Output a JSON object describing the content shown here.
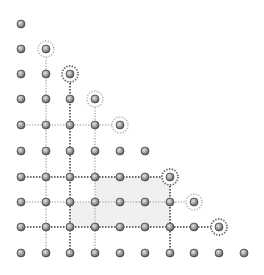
{
  "diagram": {
    "type": "triangular-lattice-grid",
    "columns_x": [
      21,
      46,
      70,
      95,
      120,
      145,
      170,
      194,
      219,
      244
    ],
    "rows_y": [
      24,
      49,
      74,
      99,
      125,
      151,
      177,
      202,
      227,
      253
    ],
    "rows_dot_count": [
      1,
      2,
      3,
      4,
      5,
      6,
      7,
      8,
      9,
      10
    ],
    "colors": {
      "background": "#ffffff",
      "dot_light": "#c8c8c8",
      "dot_dark": "#555555",
      "dot_stroke": "#4a4a4a",
      "line_dark": "#6a6a6a",
      "line_light": "#b4b4b4",
      "ring_dark": "#6a6a6a",
      "ring_light": "#b4b4b4",
      "shade": "#f0f0f0"
    },
    "shaded_regions": [
      {
        "col_from": 4,
        "col_to": 7,
        "row_from": 7,
        "row_to": 8
      },
      {
        "col_from": 3,
        "col_to": 7,
        "row_from": 8,
        "row_to": 9
      }
    ],
    "vertical_lines": [
      {
        "col": 2,
        "row_from": 2,
        "row_to": 10,
        "style": "light"
      },
      {
        "col": 3,
        "row_from": 3,
        "row_to": 10,
        "style": "dark"
      },
      {
        "col": 4,
        "row_from": 4,
        "row_to": 10,
        "style": "light"
      },
      {
        "col": 7,
        "row_from": 7,
        "row_to": 10,
        "style": "dark"
      }
    ],
    "horizontal_lines": [
      {
        "row": 5,
        "col_from": 1,
        "col_to": 5,
        "style": "light"
      },
      {
        "row": 7,
        "col_from": 1,
        "col_to": 7,
        "style": "dark"
      },
      {
        "row": 8,
        "col_from": 1,
        "col_to": 8,
        "style": "light"
      },
      {
        "row": 9,
        "col_from": 1,
        "col_to": 9,
        "style": "dark"
      }
    ],
    "rings": [
      {
        "col": 2,
        "row": 2,
        "style": "light"
      },
      {
        "col": 3,
        "row": 3,
        "style": "dark"
      },
      {
        "col": 4,
        "row": 4,
        "style": "light"
      },
      {
        "col": 5,
        "row": 5,
        "style": "light"
      },
      {
        "col": 7,
        "row": 7,
        "style": "dark"
      },
      {
        "col": 8,
        "row": 8,
        "style": "light"
      },
      {
        "col": 9,
        "row": 9,
        "style": "dark"
      }
    ],
    "dot_radius": 4,
    "ring_radius": 8
  }
}
